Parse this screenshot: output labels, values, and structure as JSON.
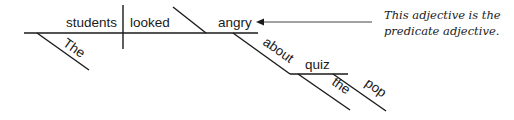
{
  "diagram": {
    "type": "sentence-diagram",
    "sentence": "The students looked angry about the pop quiz",
    "subject": "students",
    "verb": "looked",
    "predicate_adjective": "angry",
    "subject_modifiers": [
      "The"
    ],
    "adjective_modifier": {
      "preposition": "about",
      "object": "quiz",
      "object_modifiers": [
        "the",
        "pop"
      ]
    },
    "annotation": {
      "line1": "This adjective is the",
      "line2": "predicate adjective."
    },
    "line_color": "#1a1a1a",
    "arrow_color": "#444444"
  }
}
